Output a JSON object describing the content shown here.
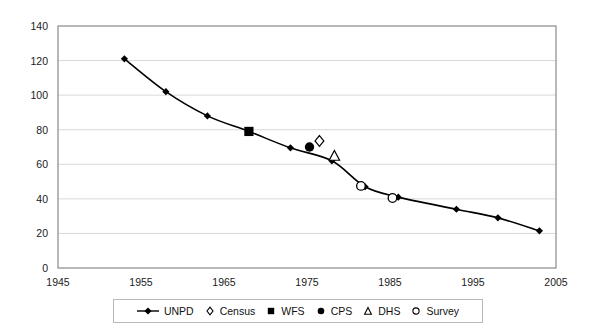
{
  "chart_data": {
    "type": "line",
    "title": "",
    "xlabel": "",
    "ylabel": "",
    "xlim": [
      1945,
      2005
    ],
    "ylim": [
      0,
      140
    ],
    "xticks": [
      1945,
      1955,
      1965,
      1975,
      1985,
      1995,
      2005
    ],
    "yticks": [
      0,
      20,
      40,
      60,
      80,
      100,
      120,
      140
    ],
    "grid": "horizontal",
    "legend_position": "bottom-center",
    "series": [
      {
        "name": "UNPD",
        "marker": "filled-diamond",
        "style": "line-with-markers",
        "points": [
          {
            "x": 1953,
            "y": 121
          },
          {
            "x": 1958,
            "y": 102
          },
          {
            "x": 1963,
            "y": 88
          },
          {
            "x": 1968,
            "y": 79
          },
          {
            "x": 1973,
            "y": 69.5
          },
          {
            "x": 1978,
            "y": 62
          },
          {
            "x": 1982,
            "y": 47
          },
          {
            "x": 1986,
            "y": 41
          },
          {
            "x": 1993,
            "y": 34
          },
          {
            "x": 1998,
            "y": 29
          },
          {
            "x": 2003,
            "y": 21.5
          }
        ]
      },
      {
        "name": "Census",
        "marker": "open-diamond",
        "style": "markers-only",
        "points": [
          {
            "x": 1976.5,
            "y": 73.5
          }
        ]
      },
      {
        "name": "WFS",
        "marker": "filled-square",
        "style": "markers-only",
        "points": [
          {
            "x": 1968,
            "y": 79
          }
        ]
      },
      {
        "name": "CPS",
        "marker": "filled-circle",
        "style": "markers-only",
        "points": [
          {
            "x": 1975.3,
            "y": 70
          }
        ]
      },
      {
        "name": "DHS",
        "marker": "open-triangle",
        "style": "markers-only",
        "points": [
          {
            "x": 1978.3,
            "y": 65
          }
        ]
      },
      {
        "name": "Survey",
        "marker": "open-circle",
        "style": "markers-only",
        "points": [
          {
            "x": 1981.5,
            "y": 47.5
          },
          {
            "x": 1985.3,
            "y": 40.5
          }
        ]
      }
    ]
  },
  "axes": {
    "y_tick_labels": [
      "140",
      "120",
      "100",
      "80",
      "60",
      "40",
      "20",
      "0"
    ],
    "x_tick_labels": [
      "1945",
      "1955",
      "1965",
      "1975",
      "1985",
      "1995",
      "2005"
    ]
  },
  "legend": {
    "items": [
      {
        "label": "UNPD",
        "marker": "line-filled-diamond"
      },
      {
        "label": "Census",
        "marker": "open-diamond"
      },
      {
        "label": "WFS",
        "marker": "filled-square"
      },
      {
        "label": "CPS",
        "marker": "filled-circle"
      },
      {
        "label": "DHS",
        "marker": "open-triangle"
      },
      {
        "label": "Survey",
        "marker": "open-circle"
      }
    ]
  },
  "colors": {
    "series_line": "#000000",
    "grid": "#d5d5d5",
    "frame": "#808080",
    "text": "#111111",
    "background": "#ffffff"
  }
}
